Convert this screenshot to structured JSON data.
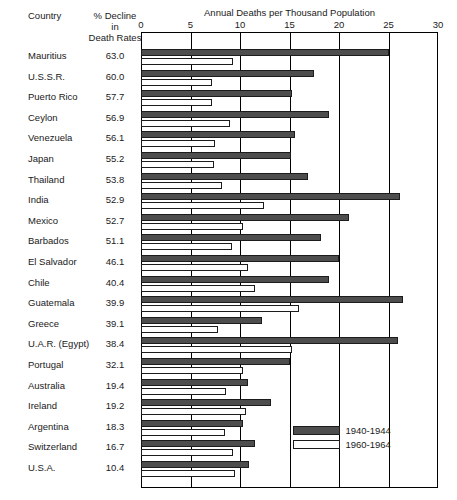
{
  "headers": {
    "country": "Country",
    "decline_line1": "% Decline",
    "decline_line2": "in",
    "decline_line3": "Death Rates",
    "axis_title": "Annual Deaths per Thousand Population"
  },
  "legend": {
    "position": "inside-bottom-right",
    "entries": [
      {
        "label": "1940-1944",
        "swatch": "dark",
        "color": "#4d4d4d"
      },
      {
        "label": "1960-1964",
        "swatch": "light",
        "color": "#ffffff"
      }
    ]
  },
  "chart_data": {
    "type": "bar",
    "orientation": "horizontal",
    "title": "",
    "xlabel": "Annual Deaths per Thousand Population",
    "ylabel": "Country",
    "xlim": [
      0,
      30
    ],
    "xticks": [
      0,
      5,
      10,
      15,
      20,
      25,
      30
    ],
    "grid": true,
    "legend_position": "inside-bottom-right",
    "categories": [
      "Mauritius",
      "U.S.S.R.",
      "Puerto Rico",
      "Ceylon",
      "Venezuela",
      "Japan",
      "Thailand",
      "India",
      "Mexico",
      "Barbados",
      "El Salvador",
      "Chile",
      "Guatemala",
      "Greece",
      "U.A.R. (Egypt)",
      "Portugal",
      "Australia",
      "Ireland",
      "Argentina",
      "Switzerland",
      "U.S.A."
    ],
    "annotation_column": {
      "header": "% Decline in Death Rates",
      "values": [
        63.0,
        60.0,
        57.7,
        56.9,
        56.1,
        55.2,
        53.8,
        52.9,
        52.7,
        51.1,
        46.1,
        40.4,
        39.9,
        39.1,
        38.4,
        32.1,
        19.4,
        19.2,
        18.3,
        16.7,
        10.4
      ]
    },
    "series": [
      {
        "name": "1940-1944",
        "color": "#4d4d4d",
        "values": [
          25.0,
          17.5,
          15.3,
          19.0,
          15.6,
          15.2,
          16.9,
          26.2,
          21.0,
          18.2,
          20.0,
          19.0,
          26.5,
          12.2,
          26.0,
          15.0,
          10.8,
          13.1,
          10.3,
          11.5,
          10.9
        ]
      },
      {
        "name": "1960-1964",
        "color": "#ffffff",
        "values": [
          9.3,
          7.2,
          7.2,
          9.0,
          7.5,
          7.4,
          8.2,
          12.4,
          10.3,
          9.2,
          10.8,
          11.5,
          16.0,
          7.8,
          15.3,
          10.3,
          8.6,
          10.6,
          8.5,
          9.3,
          9.5
        ]
      }
    ]
  }
}
